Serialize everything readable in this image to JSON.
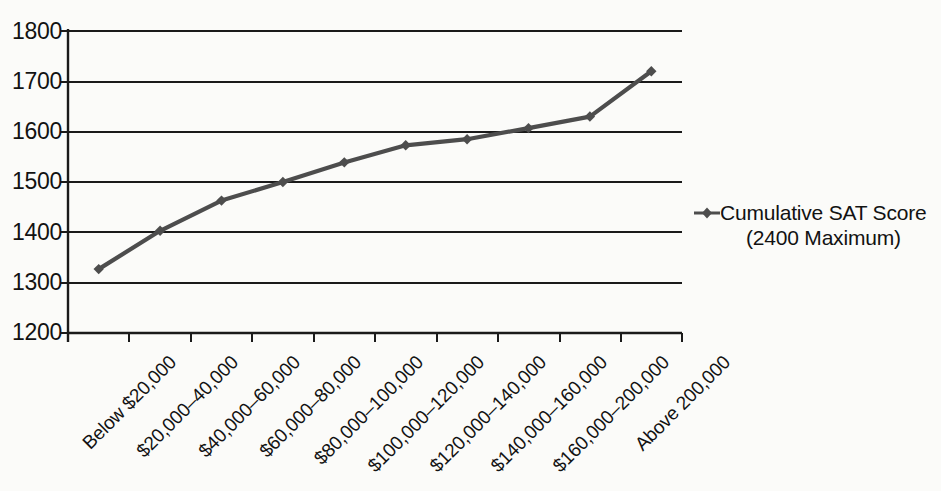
{
  "chart_data": {
    "type": "line",
    "title": "",
    "xlabel": "",
    "ylabel": "",
    "ylim": [
      1200,
      1800
    ],
    "yticks": [
      1200,
      1300,
      1400,
      1500,
      1600,
      1700,
      1800
    ],
    "grid": true,
    "legend_position": "right",
    "categories": [
      "Below $20,000",
      "$20,000–40,000",
      "$40,000–60,000",
      "$60,000–80,000",
      "$80,000–100,000",
      "$100,000–120,000",
      "$120,000–140,000",
      "$140,000–160,000",
      "$160,000–200,000",
      "Above 200,000"
    ],
    "series": [
      {
        "name": "Cumulative SAT Score (2400 Maximum)",
        "marker": "diamond",
        "values": [
          1327,
          1403,
          1463,
          1500,
          1539,
          1573,
          1585,
          1607,
          1630,
          1720
        ]
      }
    ]
  },
  "legend": {
    "line1": "Cumulative SAT Score",
    "line2": "(2400 Maximum)",
    "marker_name": "line-diamond-marker"
  },
  "colors": {
    "series": "#4d4d4d",
    "axis": "#1a1a1a",
    "grid": "#1a1a1a",
    "text": "#121212",
    "background": "#fbfbf9"
  }
}
